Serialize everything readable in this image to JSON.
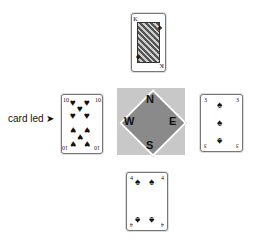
{
  "label": {
    "text": "card led",
    "arrow": "➤"
  },
  "compass": {
    "north": "N",
    "south": "S",
    "east": "E",
    "west": "W",
    "square_color": "#c8c8c8",
    "diamond_color": "#8a8a8a"
  },
  "cards": {
    "north": {
      "rank": "K",
      "suit": "♠"
    },
    "west": {
      "rank": "10",
      "suit": "♥"
    },
    "east": {
      "rank": "3",
      "suit": "♠"
    },
    "south": {
      "rank": "4",
      "suit": "♠"
    }
  }
}
